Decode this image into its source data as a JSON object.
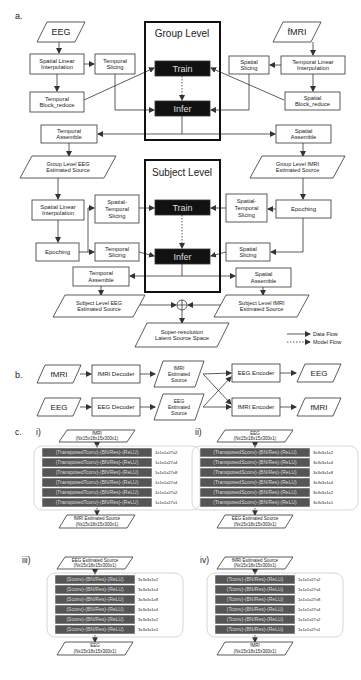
{
  "panel_a": {
    "label": "a.",
    "inputs": {
      "eeg": "EEG",
      "fmri": "fMRI"
    },
    "group_level": {
      "title": "Group Level",
      "train": "Train",
      "infer": "Infer",
      "left": {
        "spatial_linear_interpolation": [
          "Spatial Linear",
          "Interpolation"
        ],
        "temporal_slicing": [
          "Temporal",
          "Slicing"
        ],
        "temporal_block_reduce": [
          "Temporal",
          "Block_reduce"
        ],
        "temporal_assemble": [
          "Temporal",
          "Assemble"
        ]
      },
      "right": {
        "temporal_linear_interpolation": [
          "Temporal Linear",
          "Interpolation"
        ],
        "spatial_slicing": [
          "Spatial",
          "Slicing"
        ],
        "spatial_block_reduce": [
          "Spatial",
          "Block_reduce"
        ],
        "spatial_assemble": [
          "Spatial",
          "Assemble"
        ]
      },
      "outputs": {
        "eeg": [
          "Group Level EEG",
          "Estimated Source"
        ],
        "fmri": [
          "Group Level fMRI",
          "Estimated Source"
        ]
      }
    },
    "subject_level": {
      "title": "Subject Level",
      "train": "Train",
      "infer": "Infer",
      "left": {
        "spatial_linear_interpolation": [
          "Spatial Linear",
          "Interpolation"
        ],
        "spatial_temporal_slicing": [
          "Spatial-",
          "Temporal",
          "Slicing"
        ],
        "epoching": "Epoching",
        "temporal_slicing": [
          "Temporal",
          "Slicing"
        ],
        "temporal_assemble": [
          "Temporal",
          "Assemble"
        ]
      },
      "right": {
        "epoching": "Epoching",
        "spatial_temporal_slicing": [
          "Spatial-",
          "Temporal",
          "Slicing"
        ],
        "spatial_slicing": [
          "Spatial",
          "Slicing"
        ],
        "spatial_assemble": [
          "Spatial",
          "Assemble"
        ]
      },
      "outputs": {
        "eeg": [
          "Subject Level EEG",
          "Estimated Source"
        ],
        "fmri": [
          "Subject Level fMRI",
          "Estimated Source"
        ]
      }
    },
    "fusion_output": [
      "Super-resolution",
      "Latent Source Space"
    ],
    "legend": {
      "data_flow": "Data Flow",
      "model_flow": "Model Flow"
    }
  },
  "panel_b": {
    "label": "b.",
    "row1": {
      "input": "fMRI",
      "decoder": "fMRI Decoder",
      "source": [
        "fMRI",
        "Estimated",
        "Source"
      ],
      "encoder": "EEG Encoder",
      "output": "EEG"
    },
    "row2": {
      "input": "EEG",
      "decoder": "EEG Decoder",
      "source": [
        "EEG",
        "Estimated",
        "Source"
      ],
      "encoder": "fMRI Encoder",
      "output": "fMRI"
    }
  },
  "panel_c": {
    "label": "c.",
    "networks": [
      {
        "label": "i)",
        "input": [
          "fMRI",
          "(Nx15x18x15x300x1)"
        ],
        "output": [
          "fMRI Estimated Source",
          "(Nx15x18x15x300x1)"
        ],
        "layers": [
          "(TransposedTconv)-(BN/Res)-(ReLU)",
          "(TransposedTconv)-(BN/Res)-(ReLU)",
          "(TransposedTconv)-(BN/Res)-(ReLU)",
          "(TransposedTconv)-(BN/Res)-(ReLU)",
          "(TransposedTconv)-(BN/Res)-(ReLU)",
          "(TransposedTconv)-(BN/Res)-(ReLU)"
        ],
        "kernels": [
          "1x1x1x27x2",
          "1x1x1x27x4",
          "1x1x1x27x8",
          "1x1x1x27x4",
          "1x1x1x27x2",
          "1x1x1x27x1"
        ]
      },
      {
        "label": "ii)",
        "input": [
          "EEG",
          "(Nx15x18x15x300x1)"
        ],
        "output": [
          "EEG Estimated Source",
          "(Nx15x18x15x300x1)"
        ],
        "layers": [
          "(TransposedSconv)-(BN/Res)-(ReLU)",
          "(TransposedSconv)-(BN/Res)-(ReLU)",
          "(TransposedSconv)-(BN/Res)-(ReLU)",
          "(TransposedSconv)-(BN/Res)-(ReLU)",
          "(TransposedSconv)-(BN/Res)-(ReLU)",
          "(TransposedSconv)-(BN/Res)-(ReLU)"
        ],
        "kernels": [
          "3x3x3x1x2",
          "3x3x3x1x4",
          "3x3x3x1x8",
          "3x3x3x1x4",
          "3x3x3x1x2",
          "3x3x3x1x1"
        ]
      },
      {
        "label": "iii)",
        "input": [
          "EEG Estimated Source",
          "(Nx15x18x15x300x1)"
        ],
        "output": [
          "EEG",
          "(Nx15x18x15x300x1)"
        ],
        "layers": [
          "(Sconv)-(BN/Res)-(ReLU)",
          "(Sconv)-(BN/Res)-(ReLU)",
          "(Sconv)-(BN/Res)-(ReLU)",
          "(Sconv)-(BN/Res)-(ReLU)",
          "(Sconv)-(BN/Res)-(ReLU)",
          "(Sconv)-(BN/Res)-(ReLU)"
        ],
        "kernels": [
          "3x3x3x1x2",
          "3x3x3x1x4",
          "3x3x3x1x8",
          "3x3x3x1x4",
          "3x3x3x1x2",
          "3x3x3x1x1"
        ]
      },
      {
        "label": "iv)",
        "input": [
          "fMRI Estimated Source",
          "(Nx15x18x15x300x1)"
        ],
        "output": [
          "fMRI",
          "(Nx15x18x15x300x1)"
        ],
        "layers": [
          "(Tconv)-(BN/Res)-(ReLU)",
          "(Tconv)-(BN/Res)-(ReLU)",
          "(Tconv)-(BN/Res)-(ReLU)",
          "(Tconv)-(BN/Res)-(ReLU)",
          "(Tconv)-(BN/Res)-(ReLU)",
          "(Tconv)-(BN/Res)-(ReLU)"
        ],
        "kernels": [
          "1x1x1x27x2",
          "1x1x1x27x4",
          "1x1x1x27x8",
          "1x1x1x27x4",
          "1x1x1x27x2",
          "1x1x1x27x1"
        ]
      }
    ]
  },
  "colors": {
    "line": "#333333",
    "block_dark": "#111111",
    "layer_fill": "#555555",
    "layer_text": "#dddddd",
    "container_border": "#cccccc"
  }
}
